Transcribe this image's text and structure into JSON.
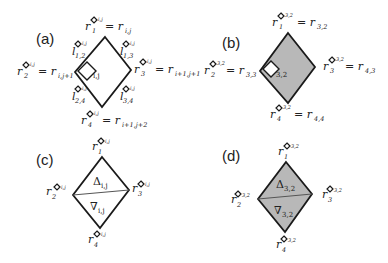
{
  "colors": {
    "stroke": "#1a1a1a",
    "gray_fill": "#b8b8b8",
    "white_fill": "#ffffff"
  },
  "panels": {
    "a": {
      "label": "(a)",
      "cell_label": "i,j",
      "corners": {
        "r1": {
          "base": "r",
          "sub": "1",
          "sup": "i,j",
          "rhs": "= r",
          "rhs_sub": "i,j"
        },
        "r2": {
          "base": "r",
          "sub": "2",
          "sup": "i,j",
          "rhs": "= r",
          "rhs_sub": "i,j+1"
        },
        "r3": {
          "base": "r",
          "sub": "3",
          "sup": "i,j",
          "rhs": "= r",
          "rhs_sub": "i+1,j+1"
        },
        "r4": {
          "base": "r",
          "sub": "4",
          "sup": "i,j",
          "rhs": "= r",
          "rhs_sub": "i+1,j+2"
        }
      },
      "edges": {
        "l12": {
          "base": "l",
          "sub": "1,2",
          "sup": "i,j"
        },
        "l13": {
          "base": "l",
          "sub": "1,3",
          "sup": "i,j"
        },
        "l24": {
          "base": "l",
          "sub": "2,4",
          "sup": "i,j"
        },
        "l34": {
          "base": "l",
          "sub": "3,4",
          "sup": "i,j"
        }
      }
    },
    "b": {
      "label": "(b)",
      "cell_label": "3,2",
      "corners": {
        "r1": {
          "base": "r",
          "sub": "1",
          "sup": "3,2",
          "rhs": "= r",
          "rhs_sub": "3,2"
        },
        "r2": {
          "base": "r",
          "sub": "2",
          "sup": "3,2",
          "rhs": "= r",
          "rhs_sub": "3,3"
        },
        "r3": {
          "base": "r",
          "sub": "3",
          "sup": "3,2",
          "rhs": "= r",
          "rhs_sub": "4,3"
        },
        "r4": {
          "base": "r",
          "sub": "4",
          "sup": "3,2",
          "rhs": "= r",
          "rhs_sub": "4,4"
        }
      }
    },
    "c": {
      "label": "(c)",
      "upper_triangle": {
        "symbol": "Δ",
        "sub": "i,j"
      },
      "lower_triangle": {
        "symbol": "∇",
        "sub": "i,j"
      },
      "corners": {
        "r1": {
          "base": "r",
          "sub": "1",
          "sup": "i,j"
        },
        "r2": {
          "base": "r",
          "sub": "2",
          "sup": "i,j"
        },
        "r3": {
          "base": "r",
          "sub": "3",
          "sup": "i,j"
        },
        "r4": {
          "base": "r",
          "sub": "4",
          "sup": "i,j"
        }
      }
    },
    "d": {
      "label": "(d)",
      "upper_triangle": {
        "symbol": "Δ",
        "sub": "3,2"
      },
      "lower_triangle": {
        "symbol": "∇",
        "sub": "3,2"
      },
      "corners": {
        "r1": {
          "base": "r",
          "sub": "1",
          "sup": "3,2"
        },
        "r2": {
          "base": "r",
          "sub": "2",
          "sup": "3,2"
        },
        "r3": {
          "base": "r",
          "sub": "3",
          "sup": "3,2"
        },
        "r4": {
          "base": "r",
          "sub": "4",
          "sup": "3,2"
        }
      }
    }
  }
}
